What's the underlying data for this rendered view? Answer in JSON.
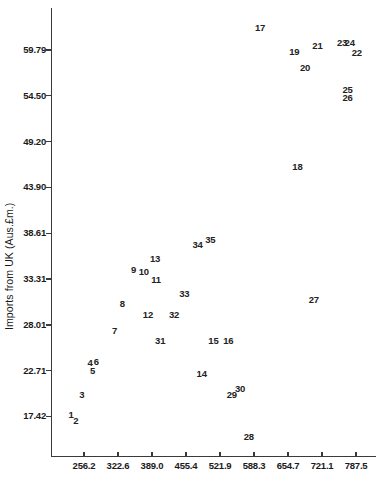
{
  "chart_data": {
    "type": "scatter",
    "title": "",
    "xlabel": "",
    "ylabel": "Imports from UK (Aus.£m.)",
    "grid": false,
    "legend": null,
    "marker_style": "numeric-label",
    "xlim": [
      223.0,
      820.7
    ],
    "ylim": [
      14.2,
      62.9
    ],
    "xticks": [
      "256.2",
      "322.6",
      "389.0",
      "455.4",
      "521.9",
      "588.3",
      "654.7",
      "721.1",
      "787.5"
    ],
    "xtick_values": [
      256.2,
      322.6,
      389.0,
      455.4,
      521.9,
      588.3,
      654.7,
      721.1,
      787.5
    ],
    "yticks": [
      "17.42",
      "22.71",
      "28.01",
      "33.31",
      "38.61",
      "43.90",
      "49.20",
      "54.50",
      "59.79"
    ],
    "ytick_values": [
      17.42,
      22.71,
      28.01,
      33.31,
      38.61,
      43.9,
      49.2,
      54.5,
      59.79
    ],
    "points": [
      {
        "label": "1",
        "x": 231.0,
        "y": 17.55
      },
      {
        "label": "2",
        "x": 240.0,
        "y": 16.95
      },
      {
        "label": "3",
        "x": 252.0,
        "y": 19.95
      },
      {
        "label": "4",
        "x": 268.0,
        "y": 23.65
      },
      {
        "label": "6",
        "x": 280.0,
        "y": 23.75
      },
      {
        "label": "5",
        "x": 273.0,
        "y": 22.7
      },
      {
        "label": "7",
        "x": 316.0,
        "y": 27.3
      },
      {
        "label": "8",
        "x": 331.0,
        "y": 30.4
      },
      {
        "label": "9",
        "x": 353.0,
        "y": 34.4
      },
      {
        "label": "10",
        "x": 373.0,
        "y": 34.1
      },
      {
        "label": "11",
        "x": 397.0,
        "y": 33.15
      },
      {
        "label": "12",
        "x": 381.0,
        "y": 29.1
      },
      {
        "label": "13",
        "x": 395.0,
        "y": 35.6
      },
      {
        "label": "14",
        "x": 486.0,
        "y": 22.3
      },
      {
        "label": "15",
        "x": 509.0,
        "y": 26.1
      },
      {
        "label": "16",
        "x": 538.0,
        "y": 26.1
      },
      {
        "label": "17",
        "x": 600.0,
        "y": 62.3
      },
      {
        "label": "18",
        "x": 673.0,
        "y": 46.25
      },
      {
        "label": "19",
        "x": 667.0,
        "y": 59.55
      },
      {
        "label": "20",
        "x": 688.0,
        "y": 57.75
      },
      {
        "label": "21",
        "x": 712.0,
        "y": 60.2
      },
      {
        "label": "22",
        "x": 789.0,
        "y": 59.45
      },
      {
        "label": "23",
        "x": 760.0,
        "y": 60.55
      },
      {
        "label": "24",
        "x": 775.0,
        "y": 60.55
      },
      {
        "label": "25",
        "x": 771.0,
        "y": 55.15
      },
      {
        "label": "26",
        "x": 771.0,
        "y": 54.2
      },
      {
        "label": "27",
        "x": 705.0,
        "y": 30.85
      },
      {
        "label": "28",
        "x": 578.0,
        "y": 15.05
      },
      {
        "label": "29",
        "x": 545.0,
        "y": 19.95
      },
      {
        "label": "30",
        "x": 561.0,
        "y": 20.65
      },
      {
        "label": "31",
        "x": 405.0,
        "y": 26.15
      },
      {
        "label": "32",
        "x": 432.0,
        "y": 29.15
      },
      {
        "label": "33",
        "x": 452.0,
        "y": 31.6
      },
      {
        "label": "34",
        "x": 478.0,
        "y": 37.3
      },
      {
        "label": "35",
        "x": 503.0,
        "y": 37.8
      }
    ]
  }
}
